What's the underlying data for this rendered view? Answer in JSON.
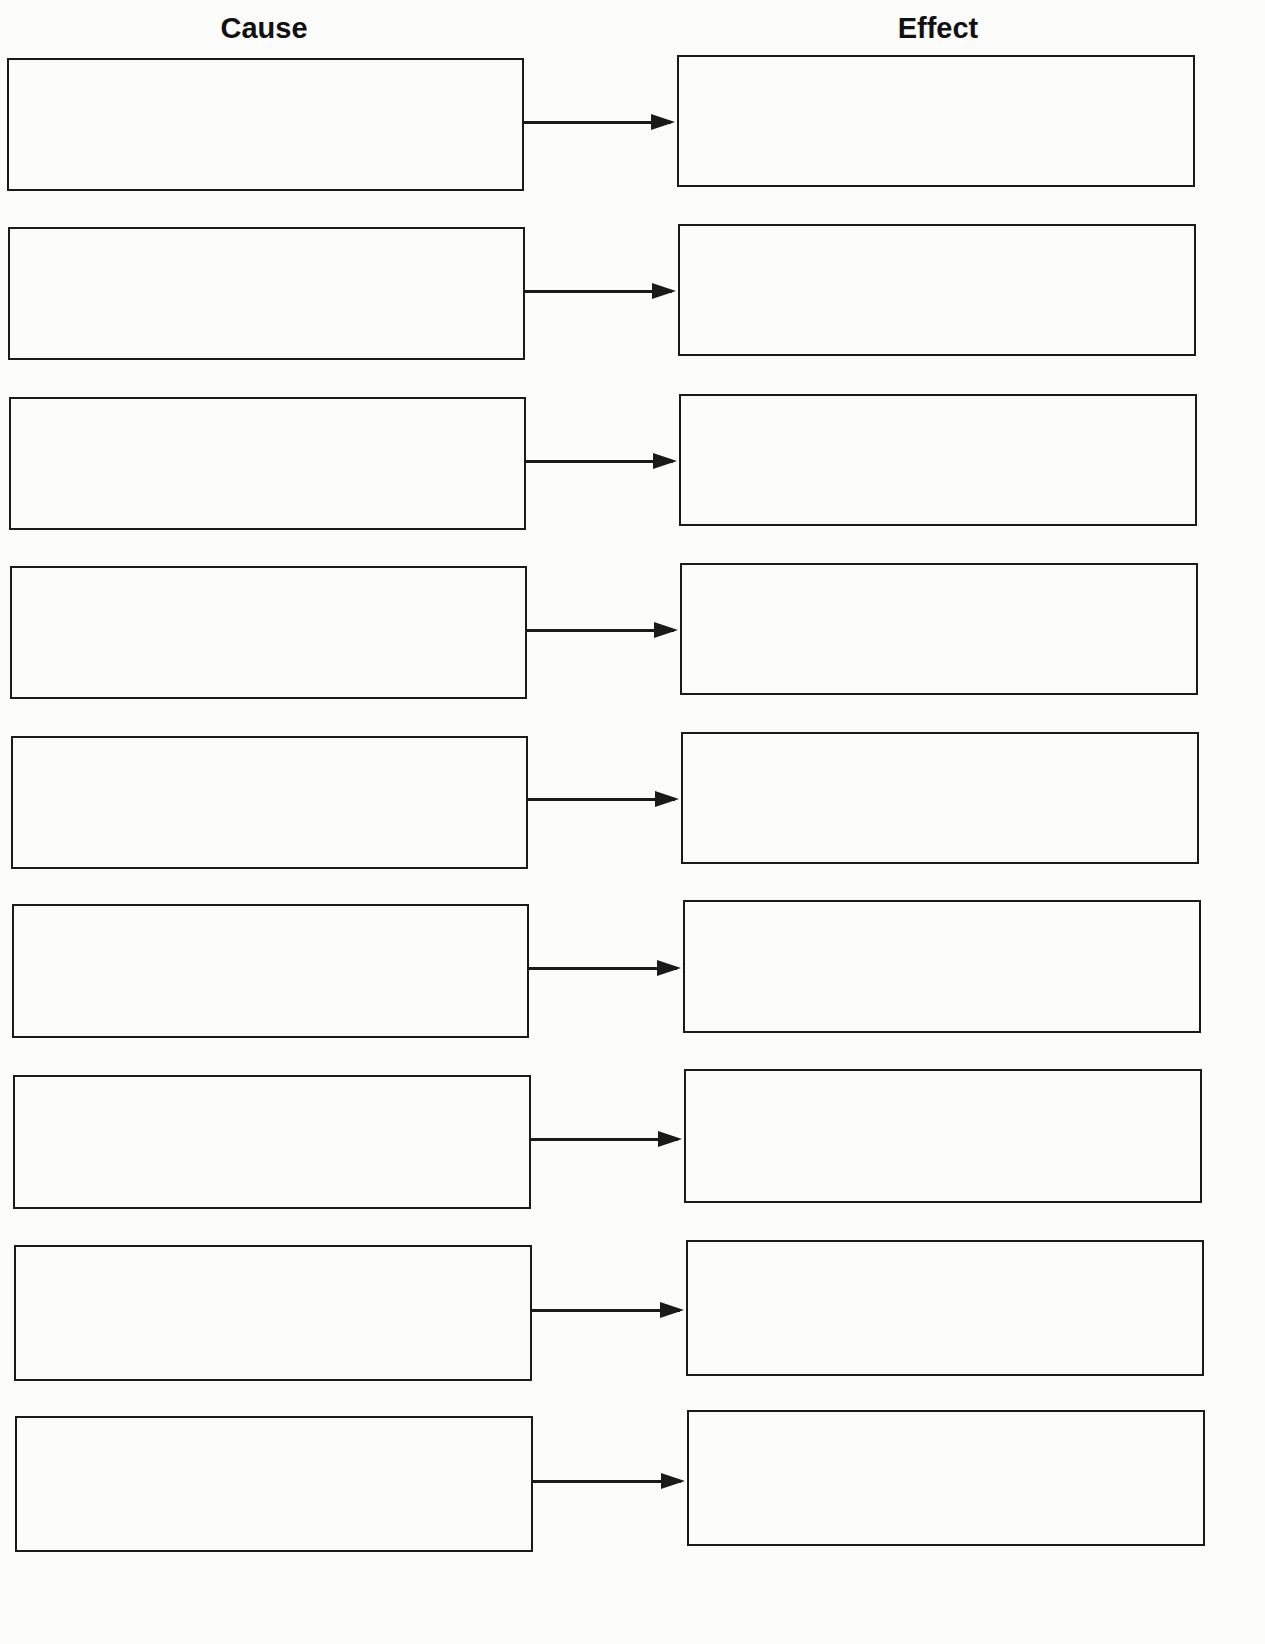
{
  "headers": {
    "cause": "Cause",
    "effect": "Effect"
  },
  "rows": [
    {
      "cause": {
        "x": 7,
        "y": 58,
        "w": 517,
        "h": 133
      },
      "effect": {
        "x": 677,
        "y": 55,
        "w": 518,
        "h": 132
      },
      "arrow_y": 122
    },
    {
      "cause": {
        "x": 8,
        "y": 227,
        "w": 517,
        "h": 133
      },
      "effect": {
        "x": 678,
        "y": 224,
        "w": 518,
        "h": 132
      },
      "arrow_y": 291
    },
    {
      "cause": {
        "x": 9,
        "y": 397,
        "w": 517,
        "h": 133
      },
      "effect": {
        "x": 679,
        "y": 394,
        "w": 518,
        "h": 132
      },
      "arrow_y": 461
    },
    {
      "cause": {
        "x": 10,
        "y": 566,
        "w": 517,
        "h": 133
      },
      "effect": {
        "x": 680,
        "y": 563,
        "w": 518,
        "h": 132
      },
      "arrow_y": 630
    },
    {
      "cause": {
        "x": 11,
        "y": 736,
        "w": 517,
        "h": 133
      },
      "effect": {
        "x": 681,
        "y": 732,
        "w": 518,
        "h": 132
      },
      "arrow_y": 799
    },
    {
      "cause": {
        "x": 12,
        "y": 904,
        "w": 517,
        "h": 134
      },
      "effect": {
        "x": 683,
        "y": 900,
        "w": 518,
        "h": 133
      },
      "arrow_y": 968
    },
    {
      "cause": {
        "x": 13,
        "y": 1075,
        "w": 518,
        "h": 134
      },
      "effect": {
        "x": 684,
        "y": 1069,
        "w": 518,
        "h": 134
      },
      "arrow_y": 1139
    },
    {
      "cause": {
        "x": 14,
        "y": 1245,
        "w": 518,
        "h": 136
      },
      "effect": {
        "x": 686,
        "y": 1240,
        "w": 518,
        "h": 136
      },
      "arrow_y": 1310
    },
    {
      "cause": {
        "x": 15,
        "y": 1416,
        "w": 518,
        "h": 136
      },
      "effect": {
        "x": 687,
        "y": 1410,
        "w": 518,
        "h": 136
      },
      "arrow_y": 1481
    }
  ]
}
